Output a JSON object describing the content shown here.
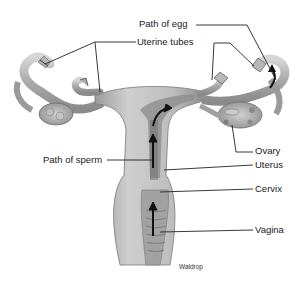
{
  "diagram": {
    "labels": {
      "path_of_egg": "Path of egg",
      "uterine_tubes": "Uterine tubes",
      "ovary": "Ovary",
      "path_of_sperm": "Path of sperm",
      "uterus": "Uterus",
      "cervix": "Cervix",
      "vagina": "Vagina"
    },
    "credit": "Waldrop",
    "colors": {
      "background": "#ffffff",
      "tissue_light": "#c8c8c8",
      "tissue_mid": "#a6a6a6",
      "tissue_dark": "#7a7a7a",
      "leader_line": "#222222",
      "arrow": "#111111"
    }
  }
}
